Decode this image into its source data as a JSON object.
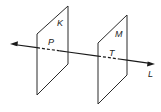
{
  "diagram": {
    "planes": [
      {
        "name": "K",
        "label": "K",
        "points": "68,6 68,64 37,95 37,34",
        "label_x": 58,
        "label_y": 26
      },
      {
        "name": "M",
        "label": "M",
        "points": "127,15 127,75 98,104 98,43",
        "label_x": 117,
        "label_y": 37
      }
    ],
    "points": [
      {
        "name": "P",
        "label": "P",
        "label_x": 49,
        "label_y": 45
      },
      {
        "name": "T",
        "label": "T",
        "label_x": 110,
        "label_y": 56
      }
    ],
    "line": {
      "name": "L",
      "label": "L",
      "label_x": 148,
      "label_y": 77,
      "start": [
        10,
        44
      ],
      "end": [
        155,
        64
      ]
    },
    "colors": {
      "stroke": "#1a1a1a",
      "background": "#ffffff"
    }
  }
}
